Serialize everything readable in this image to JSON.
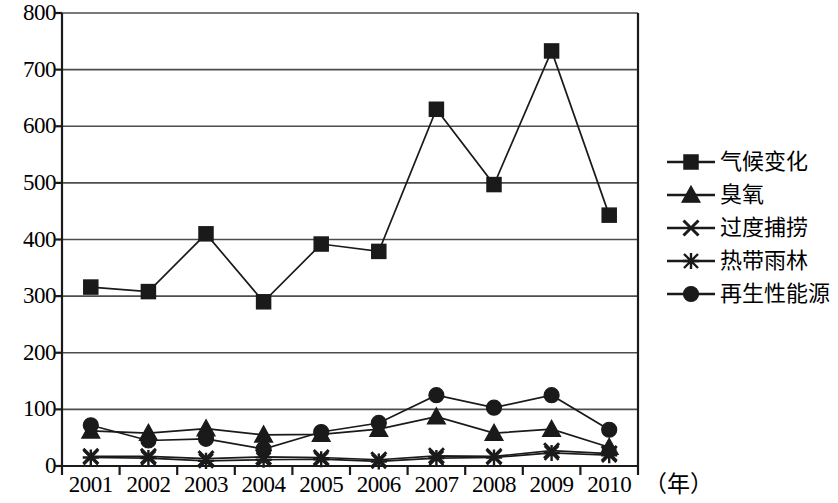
{
  "chart_data": {
    "type": "line",
    "title": "",
    "xlabel": "（年）",
    "ylabel": "",
    "x": [
      2001,
      2002,
      2003,
      2004,
      2005,
      2006,
      2007,
      2008,
      2009,
      2010
    ],
    "categories": [
      "2001",
      "2002",
      "2003",
      "2004",
      "2005",
      "2006",
      "2007",
      "2008",
      "2009",
      "2010"
    ],
    "ylim": [
      0,
      800
    ],
    "yticks": [
      0,
      100,
      200,
      300,
      400,
      500,
      600,
      700,
      800
    ],
    "ytick_labels": [
      "0",
      "100",
      "200",
      "300",
      "400",
      "500",
      "600",
      "700",
      "800"
    ],
    "grid": true,
    "legend_position": "right",
    "series": [
      {
        "name": "气候变化",
        "marker": "square",
        "values": [
          316,
          308,
          410,
          290,
          392,
          379,
          630,
          497,
          733,
          443
        ]
      },
      {
        "name": "臭氧",
        "marker": "triangle",
        "values": [
          62,
          58,
          66,
          55,
          56,
          65,
          87,
          58,
          65,
          33
        ]
      },
      {
        "name": "过度捕捞",
        "marker": "x",
        "values": [
          17,
          17,
          13,
          16,
          15,
          11,
          18,
          17,
          27,
          22
        ]
      },
      {
        "name": "热带雨林",
        "marker": "asterisk",
        "values": [
          15,
          14,
          9,
          11,
          12,
          8,
          14,
          15,
          23,
          19
        ]
      },
      {
        "name": "再生性能源",
        "marker": "circle",
        "values": [
          72,
          45,
          48,
          30,
          60,
          76,
          125,
          103,
          125,
          64
        ]
      }
    ]
  },
  "axis": {
    "x_unit_label": "（年）"
  },
  "legend": {
    "items": [
      {
        "label": "气候变化",
        "marker": "square"
      },
      {
        "label": "臭氧",
        "marker": "triangle"
      },
      {
        "label": "过度捕捞",
        "marker": "x"
      },
      {
        "label": "热带雨林",
        "marker": "asterisk"
      },
      {
        "label": "再生性能源",
        "marker": "circle"
      }
    ]
  },
  "style": {
    "line_color": "#1a1a1a",
    "grid_color": "#4d4d4d",
    "axis_color": "#1a1a1a",
    "background": "#ffffff"
  }
}
